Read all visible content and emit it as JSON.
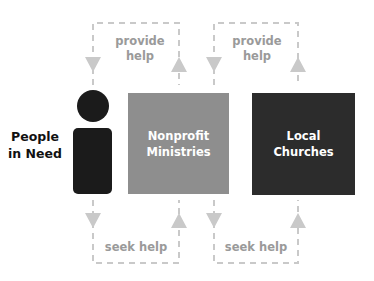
{
  "colors": {
    "person": "#1b1b1b",
    "nonprofit_box": "#8e8e8e",
    "churches_box": "#2c2c2c",
    "connector": "#c9c9c9",
    "connector_text": "#9a9a9a",
    "box_text": "#ffffff"
  },
  "nodes": {
    "people": {
      "label_line1": "People",
      "label_line2": "in Need"
    },
    "nonprofit": {
      "label_line1": "Nonprofit",
      "label_line2": "Ministries"
    },
    "churches": {
      "label_line1": "Local",
      "label_line2": "Churches"
    }
  },
  "edges": {
    "top_left": {
      "line1": "provide",
      "line2": "help"
    },
    "top_right": {
      "line1": "provide",
      "line2": "help"
    },
    "bottom_left": {
      "label": "seek help"
    },
    "bottom_right": {
      "label": "seek help"
    }
  }
}
